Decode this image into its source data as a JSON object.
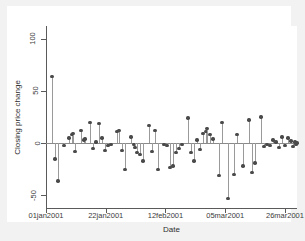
{
  "chart_data": {
    "type": "scatter",
    "title": "",
    "subtitle": "",
    "xlabel": "Date",
    "ylabel": "Closing price change",
    "grid": false,
    "legend": null,
    "style": "spike-with-markers",
    "ylim": [
      -62,
      112
    ],
    "yticks": [
      100,
      50,
      0,
      -50
    ],
    "ytick_labels": [
      "100",
      "50",
      "0",
      "-50"
    ],
    "xlim_labels": [
      "01jan2001",
      "26mar2001"
    ],
    "xticks": [
      0,
      21,
      42,
      63,
      84
    ],
    "xtick_labels": [
      "01jan2001",
      "22jan2001",
      "12feb2001",
      "05mar2001",
      "26mar2001"
    ],
    "x": [
      1,
      2,
      3,
      4,
      5,
      6,
      7,
      8,
      9,
      10,
      11,
      12,
      13,
      14,
      15,
      16,
      17,
      18,
      19,
      20,
      21,
      22,
      23,
      24,
      25,
      26,
      27,
      28,
      29,
      30,
      31,
      32,
      33,
      34,
      35,
      36,
      37,
      38,
      39,
      40,
      41,
      42,
      43,
      44,
      45,
      46,
      47,
      48,
      49,
      50,
      51,
      52,
      53,
      54,
      55,
      56,
      57,
      58,
      59,
      60,
      61,
      62,
      63,
      64,
      65,
      66,
      67,
      68,
      69,
      70,
      71,
      72,
      73,
      74,
      75,
      76,
      77,
      78,
      79,
      80,
      81,
      82,
      83,
      84,
      85
    ],
    "values": [
      64,
      -15,
      -36,
      -2,
      5,
      8,
      9,
      -8,
      12,
      3,
      4,
      20,
      -5,
      1,
      19,
      5,
      -7,
      -2,
      -1,
      11,
      12,
      -7,
      -25,
      6,
      -1,
      -4,
      -9,
      -11,
      -17,
      17,
      -8,
      12,
      -25,
      -1,
      -2,
      -23,
      -22,
      -9,
      -5,
      -1,
      24,
      -9,
      -17,
      3,
      -6,
      9,
      11,
      14,
      8,
      4,
      -31,
      20,
      -53,
      -30,
      8,
      -22,
      22,
      -28,
      -19,
      25,
      -3,
      -1,
      -2,
      3,
      1,
      -4,
      6,
      -2,
      5,
      2,
      -3,
      1,
      -1,
      0,
      2,
      -2,
      1,
      3,
      -1,
      0,
      1,
      -2,
      2,
      0,
      -1
    ],
    "x_pixels": [
      45,
      48,
      51,
      57,
      62,
      65,
      66,
      68,
      74,
      77,
      78,
      83,
      86,
      89,
      92,
      95,
      98,
      101,
      104,
      110,
      112,
      115,
      118,
      124,
      127,
      128,
      130,
      133,
      136,
      142,
      145,
      148,
      151,
      157,
      160,
      163,
      166,
      169,
      172,
      175,
      181,
      184,
      187,
      190,
      193,
      196,
      199,
      200,
      203,
      206,
      212,
      215,
      221,
      227,
      230,
      236,
      242,
      245,
      248,
      254,
      257,
      260,
      263,
      266,
      269,
      272,
      275,
      278,
      281,
      284,
      286,
      288,
      289,
      290,
      291,
      292,
      293,
      294,
      295,
      296,
      297,
      298,
      299,
      300,
      301
    ]
  },
  "axes": {
    "y_title": "Closing price change",
    "x_title": "Date"
  },
  "colors": {
    "figure_background": "#f2f2f2",
    "plot_background": "#ffffff",
    "axis": "#5a5a5a",
    "marker": "#4a4a4a",
    "spike": "#9a9a9a",
    "zero_line": "#8a8a8a",
    "text": "#3b3b3b"
  }
}
